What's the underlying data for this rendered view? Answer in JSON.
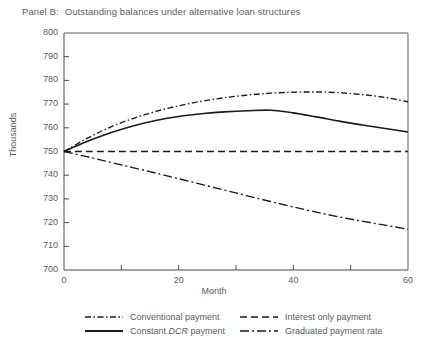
{
  "panel": {
    "label": "Panel B:",
    "title": "Outstanding balances under alternative loan structures"
  },
  "chart_data": {
    "type": "line",
    "xlabel": "Month",
    "ylabel": "Thousands",
    "xlim": [
      0,
      60
    ],
    "ylim": [
      700,
      800
    ],
    "ytick_labels": [
      "800",
      "790",
      "780",
      "770",
      "760",
      "750",
      "740",
      "730",
      "720",
      "710",
      "700"
    ],
    "ytick_values": [
      800,
      790,
      780,
      770,
      760,
      750,
      740,
      730,
      720,
      710,
      700
    ],
    "xtick_labels": [
      "0",
      "20",
      "40",
      "60"
    ],
    "xtick_values": [
      0,
      20,
      40,
      60
    ],
    "xtick_minor_values": [
      10,
      30,
      50
    ],
    "grid": false,
    "legend_position": "below",
    "series": [
      {
        "name": "Conventional payment",
        "style": "dash-dot",
        "color": "#1a1a1a",
        "x": [
          0,
          4,
          8,
          12,
          16,
          20,
          24,
          28,
          32,
          36,
          40,
          44,
          48,
          52,
          56,
          60
        ],
        "values": [
          750.0,
          755.5,
          760.2,
          763.9,
          766.9,
          769.3,
          771.2,
          772.7,
          773.8,
          774.6,
          775.0,
          775.1,
          774.8,
          774.0,
          772.8,
          771.0
        ]
      },
      {
        "name": "Constant DCR payment",
        "style": "solid",
        "color": "#1a1a1a",
        "x": [
          0,
          4,
          8,
          12,
          16,
          20,
          24,
          28,
          32,
          36,
          40,
          44,
          48,
          52,
          56,
          60
        ],
        "values": [
          750.0,
          754.2,
          757.8,
          760.8,
          763.1,
          764.8,
          765.9,
          766.7,
          767.2,
          767.4,
          766.3,
          764.6,
          762.8,
          761.2,
          759.7,
          758.2
        ]
      },
      {
        "name": "Interest only payment",
        "style": "dashed",
        "color": "#1a1a1a",
        "x": [
          0,
          20,
          40,
          60
        ],
        "values": [
          750.0,
          750.0,
          750.0,
          750.0
        ]
      },
      {
        "name": "Graduated payment rate",
        "style": "long-dash-dot",
        "color": "#1a1a1a",
        "x": [
          0,
          4,
          8,
          12,
          16,
          20,
          24,
          28,
          32,
          36,
          40,
          44,
          48,
          52,
          56,
          60
        ],
        "values": [
          750.0,
          747.8,
          745.5,
          743.2,
          740.9,
          738.5,
          736.1,
          733.7,
          731.3,
          728.9,
          726.6,
          724.4,
          722.4,
          720.6,
          718.9,
          717.2
        ]
      }
    ]
  },
  "legend": {
    "entries": [
      {
        "name": "Conventional payment",
        "style": "dash-dot"
      },
      {
        "name": "Interest only payment",
        "style": "dashed"
      },
      {
        "name": "Constant DCR payment",
        "style": "solid",
        "italic_word": "DCR"
      },
      {
        "name": "Graduated payment rate",
        "style": "long-dash-dot"
      }
    ]
  }
}
